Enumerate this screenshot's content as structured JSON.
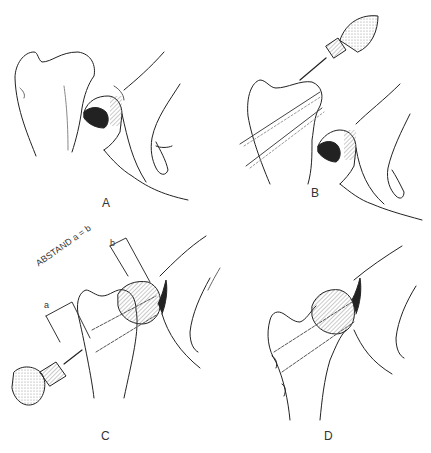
{
  "figure": {
    "panels": [
      {
        "id": "A",
        "label": "A",
        "content": "Proximal bone (femur) separated from femoral head held in hand"
      },
      {
        "id": "B",
        "label": "B",
        "content": "Drill inserting two parallel guide wires through the bone"
      },
      {
        "id": "C",
        "label": "C",
        "content": "Head reduced onto bone; drill from opposite side; equal distances a and b marked",
        "annotations": {
          "distance_note": "ABSTAND a = b",
          "mark_a": "a",
          "mark_b": "b"
        }
      },
      {
        "id": "D",
        "label": "D",
        "content": "Final fixation with two parallel wires through head and bone"
      }
    ],
    "colors": {
      "ink": "#222222",
      "background": "#ffffff",
      "shading": "#555555"
    }
  }
}
